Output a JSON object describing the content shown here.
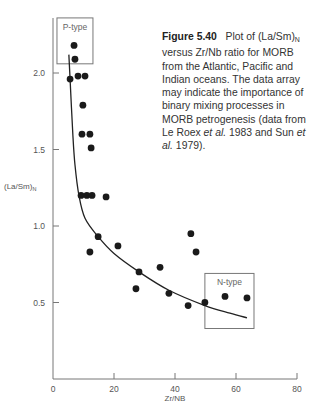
{
  "caption": {
    "figure_label": "Figure 5.40",
    "text_1": "Plot of (La/Sm)",
    "text_1_sub": "N",
    "text_2": " versus Zr/Nb ratio for MORB from the Atlantic, Pacific and Indian oceans. The data array may indicate the importance of binary mixing processes in MORB petrogenesis (data from Le Roex ",
    "etal_1": "et al.",
    "text_3": " 1983 and Sun ",
    "etal_2": "et al.",
    "text_4": " 1979)."
  },
  "chart_data": {
    "type": "scatter",
    "title": "Plot of (La/Sm)N versus Zr/Nb ratio for MORB from the Atlantic, Pacific and Indian oceans",
    "xlabel": "Zr/NB",
    "ylabel": "(La/Sm)N",
    "xlim": [
      0,
      80
    ],
    "ylim": [
      0,
      2.4
    ],
    "x_ticks": [
      0,
      20,
      40,
      60,
      80
    ],
    "y_ticks": [
      0.5,
      1.0,
      1.5,
      2.0
    ],
    "x_tick_labels": [
      "0",
      "20",
      "40",
      "60",
      "80"
    ],
    "y_tick_labels": [
      "0.5",
      "1.0",
      "1.5",
      "2.0"
    ],
    "grid": false,
    "legend": null,
    "series": [
      {
        "name": "MORB samples",
        "points": [
          [
            6.9,
            2.18
          ],
          [
            7.2,
            2.09
          ],
          [
            5.6,
            1.96
          ],
          [
            8.2,
            1.98
          ],
          [
            10.5,
            1.98
          ],
          [
            9.8,
            1.79
          ],
          [
            9.5,
            1.6
          ],
          [
            12.1,
            1.6
          ],
          [
            12.5,
            1.51
          ],
          [
            9.2,
            1.2
          ],
          [
            11.1,
            1.2
          ],
          [
            12.8,
            1.2
          ],
          [
            17.4,
            1.19
          ],
          [
            14.8,
            0.93
          ],
          [
            12.1,
            0.83
          ],
          [
            21.3,
            0.87
          ],
          [
            28.2,
            0.7
          ],
          [
            27.2,
            0.59
          ],
          [
            35.1,
            0.73
          ],
          [
            38.0,
            0.56
          ],
          [
            45.2,
            0.95
          ],
          [
            46.9,
            0.83
          ],
          [
            44.3,
            0.48
          ],
          [
            49.8,
            0.5
          ],
          [
            56.4,
            0.54
          ],
          [
            63.6,
            0.53
          ]
        ]
      },
      {
        "name": "Binary mixing curve",
        "type": "line",
        "points": [
          [
            5.2,
            2.12
          ],
          [
            5.6,
            1.96
          ],
          [
            6.5,
            1.6
          ],
          [
            7.2,
            1.4
          ],
          [
            8.5,
            1.2
          ],
          [
            10.5,
            1.05
          ],
          [
            14.8,
            0.93
          ],
          [
            20,
            0.82
          ],
          [
            28.2,
            0.7
          ],
          [
            38.0,
            0.58
          ],
          [
            49.8,
            0.48
          ],
          [
            58,
            0.43
          ],
          [
            63.6,
            0.4
          ]
        ]
      }
    ],
    "annotations": [
      {
        "label": "P-type",
        "box": {
          "x": [
            1.3,
            13.1
          ],
          "y": [
            2.06,
            2.36
          ]
        }
      },
      {
        "label": "N-type",
        "box": {
          "x": [
            49.8,
            65.9
          ],
          "y": [
            0.33,
            0.69
          ]
        }
      }
    ]
  }
}
